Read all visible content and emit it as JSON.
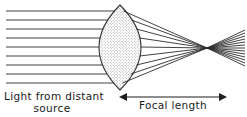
{
  "figure": {
    "canvas": {
      "width": 247,
      "height": 117,
      "background": "#ffffff"
    },
    "labels": {
      "source_line1": "Light from distant",
      "source_line2": "source",
      "focal_length": "Focal length"
    },
    "colors": {
      "ray": "#2b2b2b",
      "lens_outline": "#333333",
      "lens_fill": "#d9d9d9",
      "text": "#1a1a1a",
      "arrow": "#1f1f1f"
    },
    "lens": {
      "type": "biconvex",
      "top_vertex_x": 120,
      "top_vertex_y": 5,
      "bottom_vertex_x": 120,
      "bottom_vertex_y": 90,
      "left_edge_x": 100,
      "right_edge_x": 141,
      "mid_y": 47.5,
      "fill_pattern": "stipple"
    },
    "focal_point": {
      "x": 207,
      "y": 48
    },
    "incoming_rays": {
      "count": 9,
      "start_x": 6,
      "y_positions": [
        11,
        20,
        29,
        38,
        47,
        56,
        65,
        74,
        83
      ]
    },
    "outgoing_rays": {
      "extends_to_x": 245,
      "diverge_after_focus": true
    },
    "focal_arrow": {
      "left_x": 120,
      "right_x": 226,
      "y": 97,
      "double_headed": true
    },
    "source_label_position": {
      "x": 4,
      "y": 99,
      "line2_x": 52,
      "line2_y": 111
    },
    "focal_label_position": {
      "x": 173,
      "y": 108
    }
  }
}
